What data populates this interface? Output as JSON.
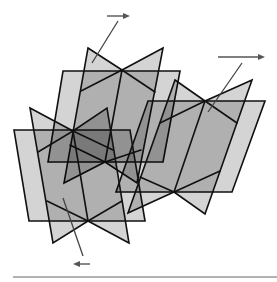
{
  "diagram": {
    "colors": {
      "plane_fill_single_layer": "#d4d4d4",
      "plane_fill_double_overlap": "#b0b0b0",
      "outline": "#111111",
      "arrow": "#555555",
      "baseline": "#9a9a9a"
    },
    "groups": [
      {
        "id": "group-top",
        "parallelogram": [
          [
            63,
            71
          ],
          [
            180,
            71
          ],
          [
            163,
            162
          ],
          [
            48,
            162
          ]
        ],
        "bowtie": {
          "top_left": [
            88,
            48
          ],
          "top_center": [
            122,
            70
          ],
          "top_right": [
            163,
            48
          ],
          "bottom_right": [
            137,
            183
          ],
          "bottom_center": [
            105,
            162
          ],
          "bottom_left": [
            64,
            183
          ],
          "upper_arms": [
            [
              81,
              91
            ],
            [
              155,
              92
            ]
          ],
          "lower_arms": [
            [
              70,
              145
            ],
            [
              141,
              150
            ]
          ]
        }
      },
      {
        "id": "group-right",
        "parallelogram": [
          [
            148,
            101
          ],
          [
            265,
            101
          ],
          [
            232,
            192
          ],
          [
            116,
            192
          ]
        ],
        "bowtie": {
          "top_left": [
            175,
            80
          ],
          "top_center": [
            205,
            101
          ],
          "top_right": [
            252,
            80
          ],
          "bottom_right": [
            205,
            214
          ],
          "bottom_center": [
            174,
            192
          ],
          "bottom_left": [
            128,
            213
          ],
          "upper_arms": [
            [
              160,
              123
            ],
            [
              237,
              123
            ]
          ],
          "lower_arms": [
            [
              140,
              177
            ],
            [
              220,
              171
            ]
          ]
        }
      },
      {
        "id": "group-left",
        "parallelogram": [
          [
            14,
            130
          ],
          [
            130,
            130
          ],
          [
            145,
            221
          ],
          [
            29,
            221
          ]
        ],
        "bowtie": {
          "top_left": [
            30,
            108
          ],
          "top_center": [
            73,
            131
          ],
          "top_right": [
            107,
            108
          ],
          "bottom_right": [
            129,
            243
          ],
          "bottom_center": [
            88,
            221
          ],
          "bottom_left": [
            53,
            243
          ],
          "upper_arms": [
            [
              38,
              152
            ],
            [
              113,
              150
            ]
          ],
          "lower_arms": [
            [
              47,
              201
            ],
            [
              122,
              201
            ]
          ]
        }
      }
    ],
    "arrows": [
      {
        "id": "arrow-top",
        "direction": "right",
        "shaft": [
          [
            107,
            16
          ],
          [
            130,
            16
          ]
        ],
        "pointer": [
          [
            118,
            21
          ],
          [
            92,
            63
          ]
        ]
      },
      {
        "id": "arrow-right",
        "direction": "right",
        "shaft": [
          [
            218,
            57
          ],
          [
            265,
            57
          ]
        ],
        "pointer": [
          [
            242,
            63
          ],
          [
            208,
            112
          ]
        ]
      },
      {
        "id": "arrow-bottom",
        "direction": "left",
        "shaft": [
          [
            90,
            264
          ],
          [
            73,
            264
          ]
        ],
        "pointer": [
          [
            63,
            198
          ],
          [
            83,
            256
          ]
        ]
      }
    ],
    "baseline": {
      "from": [
        13,
        277
      ],
      "to": [
        277,
        277
      ]
    }
  }
}
